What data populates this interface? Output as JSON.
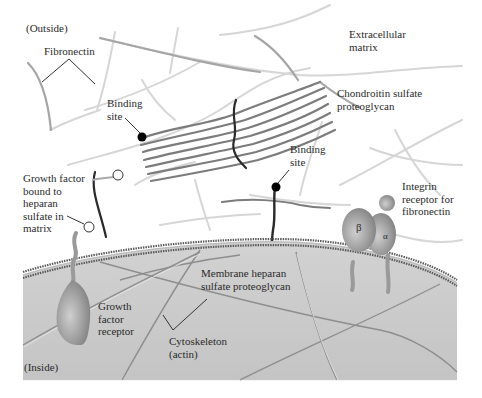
{
  "labels": {
    "outside": "(Outside)",
    "inside": "(Inside)",
    "fibronectin": "Fibronectin",
    "extracellular_matrix": "Extracellular\nmatrix",
    "chondroitin": "Chondroitin sulfate\nproteoglycan",
    "binding_site_1": "Binding\nsite",
    "binding_site_2": "Binding\nsite",
    "growth_factor_bound": "Growth factor\nbound to\nheparan\nsulfate in\nmatrix",
    "integrin": "Integrin\nreceptor for\nfibronectin",
    "beta": "β",
    "alpha": "α",
    "membrane_heparan": "Membrane heparan\nsulfate proteoglycan",
    "growth_factor_receptor": "Growth\nfactor\nreceptor",
    "cytoskeleton": "Cytoskeleton\n(actin)"
  },
  "colors": {
    "background": "#ffffff",
    "cytoplasm": "#c9c9c9",
    "membrane": "#6b6b6b",
    "matrix_fiber": "#d4d4d4",
    "fibronectin_fiber": "#9a9a9a",
    "proteoglycan_strand": "#7a7a7a",
    "core_protein": "#2a2a2a",
    "binding_dot": "#000000",
    "protein": "#9e9e9e",
    "text": "#2a2a2a"
  }
}
